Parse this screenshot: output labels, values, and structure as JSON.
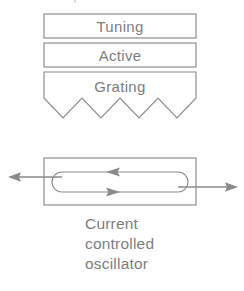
{
  "figure": {
    "line_color": "#8a8a8a",
    "text_color": "#7d7d7d",
    "background_color": "#ffffff",
    "width": 244,
    "height": 291
  },
  "layer_stack": {
    "name": "laser-layer-stack",
    "layers": [
      {
        "id": "tuning",
        "label": "Tuning",
        "shape": "rectangle",
        "x": 44,
        "y": 14,
        "width": 152,
        "height": 24
      },
      {
        "id": "active",
        "label": "Active",
        "shape": "rectangle",
        "x": 44,
        "y": 43,
        "width": 152,
        "height": 24
      },
      {
        "id": "grating",
        "label": "Grating",
        "shape": "sawtooth-bottom-rectangle",
        "x": 44,
        "y": 72,
        "width": 152,
        "height": 26,
        "teeth": 4,
        "tooth_depth": 20
      }
    ]
  },
  "oscillator": {
    "name": "current-controlled-oscillator",
    "cavity_rect": {
      "x": 44,
      "y": 158,
      "width": 152,
      "height": 47
    },
    "loop": {
      "x": 52,
      "y": 172,
      "width": 136,
      "height": 20,
      "shape": "stadium"
    },
    "arrows": [
      {
        "id": "output-left",
        "direction": "left",
        "y": 177,
        "from_x": 60,
        "to_x": 8
      },
      {
        "id": "output-right",
        "direction": "right",
        "y": 187,
        "from_x": 180,
        "to_x": 238
      },
      {
        "id": "loop-top",
        "direction": "left",
        "y": 172,
        "head_x": 106
      },
      {
        "id": "loop-bottom",
        "direction": "right",
        "y": 192,
        "head_x": 118
      }
    ]
  },
  "caption": {
    "name": "figure-caption",
    "lines": [
      "Current",
      "controlled",
      "oscillator"
    ],
    "x": 85,
    "align": "left"
  }
}
